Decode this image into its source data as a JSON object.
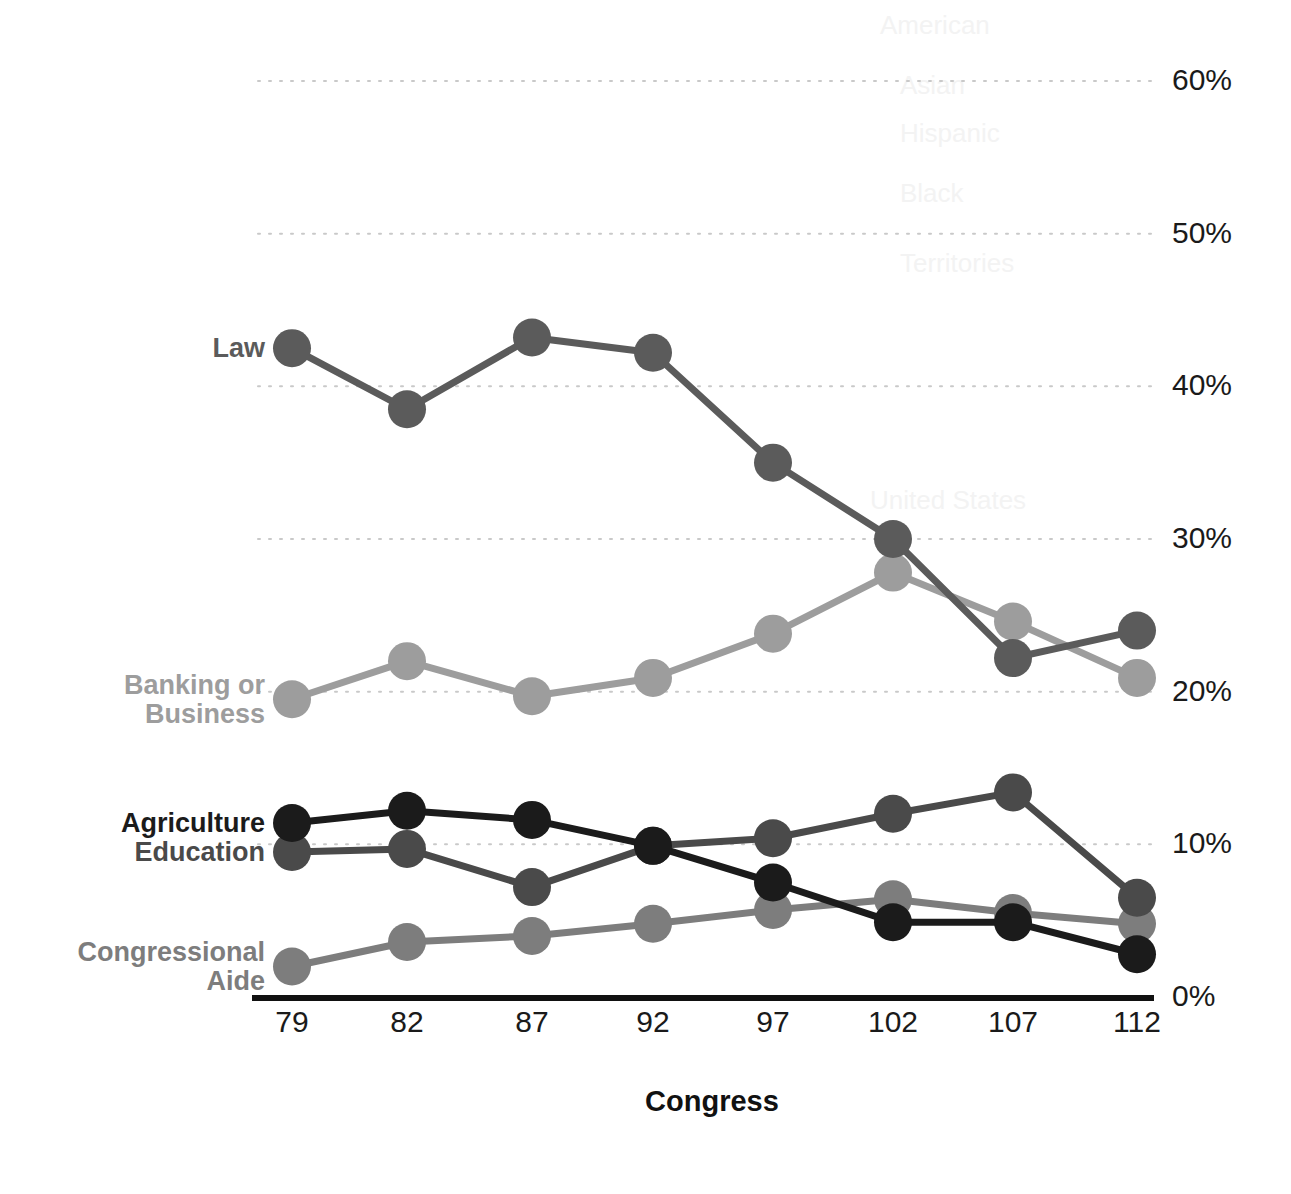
{
  "chart_data": {
    "type": "line",
    "title": "",
    "xlabel": "Congress",
    "ylabel": "",
    "categories": [
      "79",
      "82",
      "87",
      "92",
      "97",
      "102",
      "107",
      "112"
    ],
    "x_tick_labels": [
      "79",
      "82",
      "87",
      "92",
      "97",
      "102",
      "107",
      "112"
    ],
    "y_tick_labels": [
      "0%",
      "10%",
      "20%",
      "30%",
      "40%",
      "50%",
      "60%"
    ],
    "y_ticks": [
      0,
      10,
      20,
      30,
      40,
      50,
      60
    ],
    "ylim": [
      0,
      60
    ],
    "grid": "horizontal-dotted",
    "legend_position": "inline-left-labels",
    "units": "percent",
    "series": [
      {
        "name": "Law",
        "color": "#5b5b5b",
        "label": "Law",
        "values": [
          42.5,
          38.5,
          43.2,
          42.2,
          35.0,
          30.0,
          22.2,
          24.0
        ]
      },
      {
        "name": "Banking or Business",
        "color": "#9d9d9d",
        "label": "Banking or\nBusiness",
        "values": [
          19.5,
          22.0,
          19.7,
          20.9,
          23.8,
          27.8,
          24.6,
          20.9
        ]
      },
      {
        "name": "Agriculture",
        "color": "#1b1b1b",
        "label": "Agriculture",
        "values": [
          11.4,
          12.2,
          11.6,
          9.9,
          7.5,
          4.9,
          4.9,
          2.8
        ]
      },
      {
        "name": "Education",
        "color": "#4a4a4a",
        "label": "Education",
        "values": [
          9.5,
          9.7,
          7.2,
          9.9,
          10.4,
          12.0,
          13.4,
          6.5
        ]
      },
      {
        "name": "Congressional Aide",
        "color": "#7d7d7d",
        "label": "Congressional\nAide",
        "values": [
          2.0,
          3.6,
          4.0,
          4.8,
          5.7,
          6.4,
          5.5,
          4.8
        ]
      }
    ]
  },
  "bleed_through": [
    {
      "text": "American",
      "x": 880,
      "y": 10
    },
    {
      "text": "Asian",
      "x": 900,
      "y": 70
    },
    {
      "text": "Hispanic",
      "x": 900,
      "y": 118
    },
    {
      "text": "Black",
      "x": 900,
      "y": 178
    },
    {
      "text": "Territories",
      "x": 900,
      "y": 248
    },
    {
      "text": "United States",
      "x": 870,
      "y": 485
    }
  ]
}
